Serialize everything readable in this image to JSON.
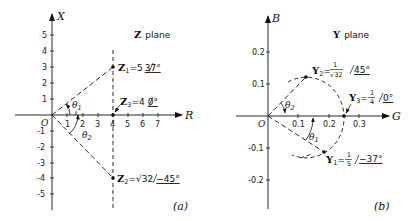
{
  "panel_a": {
    "title_symbol": "Z",
    "title_text": "plane",
    "x_axis_label": "R",
    "y_axis_label": "X",
    "origin_label": "O",
    "x_ticks": [
      "1",
      "2",
      "3",
      "4",
      "5",
      "6",
      "7"
    ],
    "y_ticks_pos": [
      "1",
      "2",
      "3",
      "4",
      "5"
    ],
    "y_ticks_neg": [
      "-1",
      "-2",
      "-3",
      "-4",
      "-5"
    ],
    "points": {
      "z1": {
        "symbol": "Z",
        "sub": "1",
        "eq": "=5",
        "angle": "37°"
      },
      "z2": {
        "symbol": "Z",
        "sub": "2",
        "eq": "=√32",
        "angle": "−45°"
      },
      "z3": {
        "symbol": "Z",
        "sub": "3",
        "eq": "=4",
        "angle": "0°"
      }
    },
    "angles": {
      "theta1": "θ",
      "theta1_sub": "1",
      "theta2": "θ",
      "theta2_sub": "2"
    },
    "caption": "(a)"
  },
  "panel_b": {
    "title_symbol": "Y",
    "title_text": "plane",
    "x_axis_label": "G",
    "y_axis_label": "B",
    "origin_label": "O",
    "x_ticks": [
      "0.1",
      "0.2",
      "0.3"
    ],
    "y_ticks_pos": [
      "0.1",
      "0.2"
    ],
    "y_ticks_neg": [
      "-0.1",
      "-0.2"
    ],
    "points": {
      "y1": {
        "symbol": "Y",
        "sub": "1",
        "eq": "=",
        "num": "1",
        "den": "5",
        "angle": "−37°"
      },
      "y2": {
        "symbol": "Y",
        "sub": "2",
        "eq": "=",
        "num": "1",
        "den": "√32",
        "angle": "45°"
      },
      "y3": {
        "symbol": "Y",
        "sub": "3",
        "eq": "=",
        "num": "1",
        "den": "4",
        "angle": "0°"
      }
    },
    "angles": {
      "theta1": "θ",
      "theta1_sub": "1",
      "theta2": "θ",
      "theta2_sub": "2"
    },
    "caption": "(b)"
  }
}
